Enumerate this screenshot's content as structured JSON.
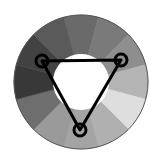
{
  "title": "Triadic color harmony wheel",
  "wheel": {
    "center": [
      81,
      82
    ],
    "outer_radius": 67,
    "inner_radius": 28,
    "segment_count": 12,
    "segment_start_angle_deg": -15,
    "outline_color": "#555555",
    "segments": [
      {
        "angle": 0,
        "color": "#6a6a6a"
      },
      {
        "angle": 30,
        "color": "#7a7a7a"
      },
      {
        "angle": 60,
        "color": "#8e8e8e"
      },
      {
        "angle": 90,
        "color": "#b4b4b4"
      },
      {
        "angle": 120,
        "color": "#dedede"
      },
      {
        "angle": 150,
        "color": "#b0b0b0"
      },
      {
        "angle": 180,
        "color": "#a4a4a4"
      },
      {
        "angle": 210,
        "color": "#9a9a9a"
      },
      {
        "angle": 240,
        "color": "#6e6e6e"
      },
      {
        "angle": 270,
        "color": "#383838"
      },
      {
        "angle": 300,
        "color": "#424242"
      },
      {
        "angle": 330,
        "color": "#5a5a5a"
      }
    ]
  },
  "triad": {
    "line_color": "#000000",
    "line_width": 3,
    "handle_radius": 6,
    "handle_stroke": 3,
    "handles": [
      {
        "name": "handle-left",
        "x": 42,
        "y": 61
      },
      {
        "name": "handle-right",
        "x": 121,
        "y": 60
      },
      {
        "name": "handle-bottom",
        "x": 80,
        "y": 130
      }
    ]
  }
}
